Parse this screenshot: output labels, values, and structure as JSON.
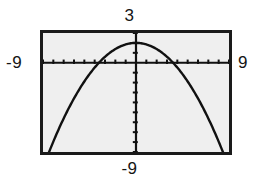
{
  "screen": {
    "kind": "graphing-calculator-viewing-window",
    "width": 259,
    "height": 183,
    "background_color": "#ffffff",
    "plot_background_color": "#efefef",
    "frame_color": "#1a1a1a",
    "curve_color": "#111111"
  },
  "labels": {
    "top": "3",
    "bottom": "-9",
    "left": "-9",
    "right": "9"
  },
  "chart_data": {
    "type": "line",
    "title": "",
    "subtitle": "",
    "xlabel": "",
    "ylabel": "",
    "xlim": [
      -9,
      9
    ],
    "ylim": [
      -9,
      3
    ],
    "grid": false,
    "legend_position": "none",
    "x_tick_labels": [
      "-9",
      "9"
    ],
    "y_tick_labels": [
      "3",
      "-9"
    ],
    "x_tick_step": 1,
    "y_tick_step": 1,
    "axes": {
      "x_axis_y_value": 0,
      "y_axis_x_value": 0,
      "show_x_axis": true,
      "show_y_axis": true,
      "tick_marks": true
    },
    "annotations": [
      "downward-opening parabola",
      "vertex near (0, 2)",
      "x-intercepts near x = -3.6 and x = 3.6"
    ],
    "series": [
      {
        "name": "y = -0.155x^2 + 2",
        "color": "#111111",
        "vertex": [
          0,
          2
        ],
        "opens": "down",
        "x": [
          -8.6,
          -8.0,
          -7.0,
          -6.0,
          -5.0,
          -4.0,
          -3.6,
          -3.0,
          -2.0,
          -1.0,
          0.0,
          1.0,
          2.0,
          3.0,
          3.6,
          4.0,
          5.0,
          6.0,
          7.0,
          8.0,
          8.6
        ],
        "values": [
          -9.5,
          -7.9,
          -5.6,
          -3.6,
          -1.9,
          -0.5,
          0.0,
          0.6,
          1.4,
          1.85,
          2.0,
          1.85,
          1.4,
          0.6,
          0.0,
          -0.5,
          -1.9,
          -3.6,
          -5.6,
          -7.9,
          -9.5
        ]
      }
    ]
  }
}
